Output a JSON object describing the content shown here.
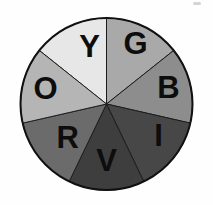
{
  "figure": {
    "background": "#fefefe"
  },
  "wheel": {
    "type": "pie",
    "center_x": 106.5,
    "center_y": 104,
    "radius": 86,
    "outline_color": "#111111",
    "divider_color": "#1c1c1c",
    "letter_color": "#0d0d0d",
    "letter_font_size": 31,
    "segments": [
      {
        "label": "Y",
        "color_name": "yellow",
        "fill": "#e7e7e7",
        "start_deg": 90,
        "end_deg": 141.43,
        "label_angle_deg": 106,
        "label_radius": 61
      },
      {
        "label": "G",
        "color_name": "green",
        "fill": "#a9a9a9",
        "start_deg": 38.57,
        "end_deg": 90,
        "label_angle_deg": 64.6,
        "label_radius": 67.5
      },
      {
        "label": "B",
        "color_name": "blue",
        "fill": "#8d8d8d",
        "start_deg": -12.86,
        "end_deg": 38.57,
        "label_angle_deg": 15.3,
        "label_radius": 64.3
      },
      {
        "label": "I",
        "color_name": "indigo",
        "fill": "#474747",
        "start_deg": -64.29,
        "end_deg": -12.86,
        "label_angle_deg": -30.8,
        "label_radius": 60.5
      },
      {
        "label": "V",
        "color_name": "violet",
        "fill": "#3e3e3e",
        "start_deg": -115.71,
        "end_deg": -64.29,
        "label_angle_deg": -90,
        "label_radius": 56
      },
      {
        "label": "R",
        "color_name": "red",
        "fill": "#6b6b6b",
        "start_deg": -167.14,
        "end_deg": -115.71,
        "label_angle_deg": -139.7,
        "label_radius": 51
      },
      {
        "label": "O",
        "color_name": "orange",
        "fill": "#b5b5b5",
        "start_deg": 141.43,
        "end_deg": 192.86,
        "label_angle_deg": 165.3,
        "label_radius": 63
      }
    ]
  },
  "artifact": {
    "color": "#cdcdcd"
  }
}
